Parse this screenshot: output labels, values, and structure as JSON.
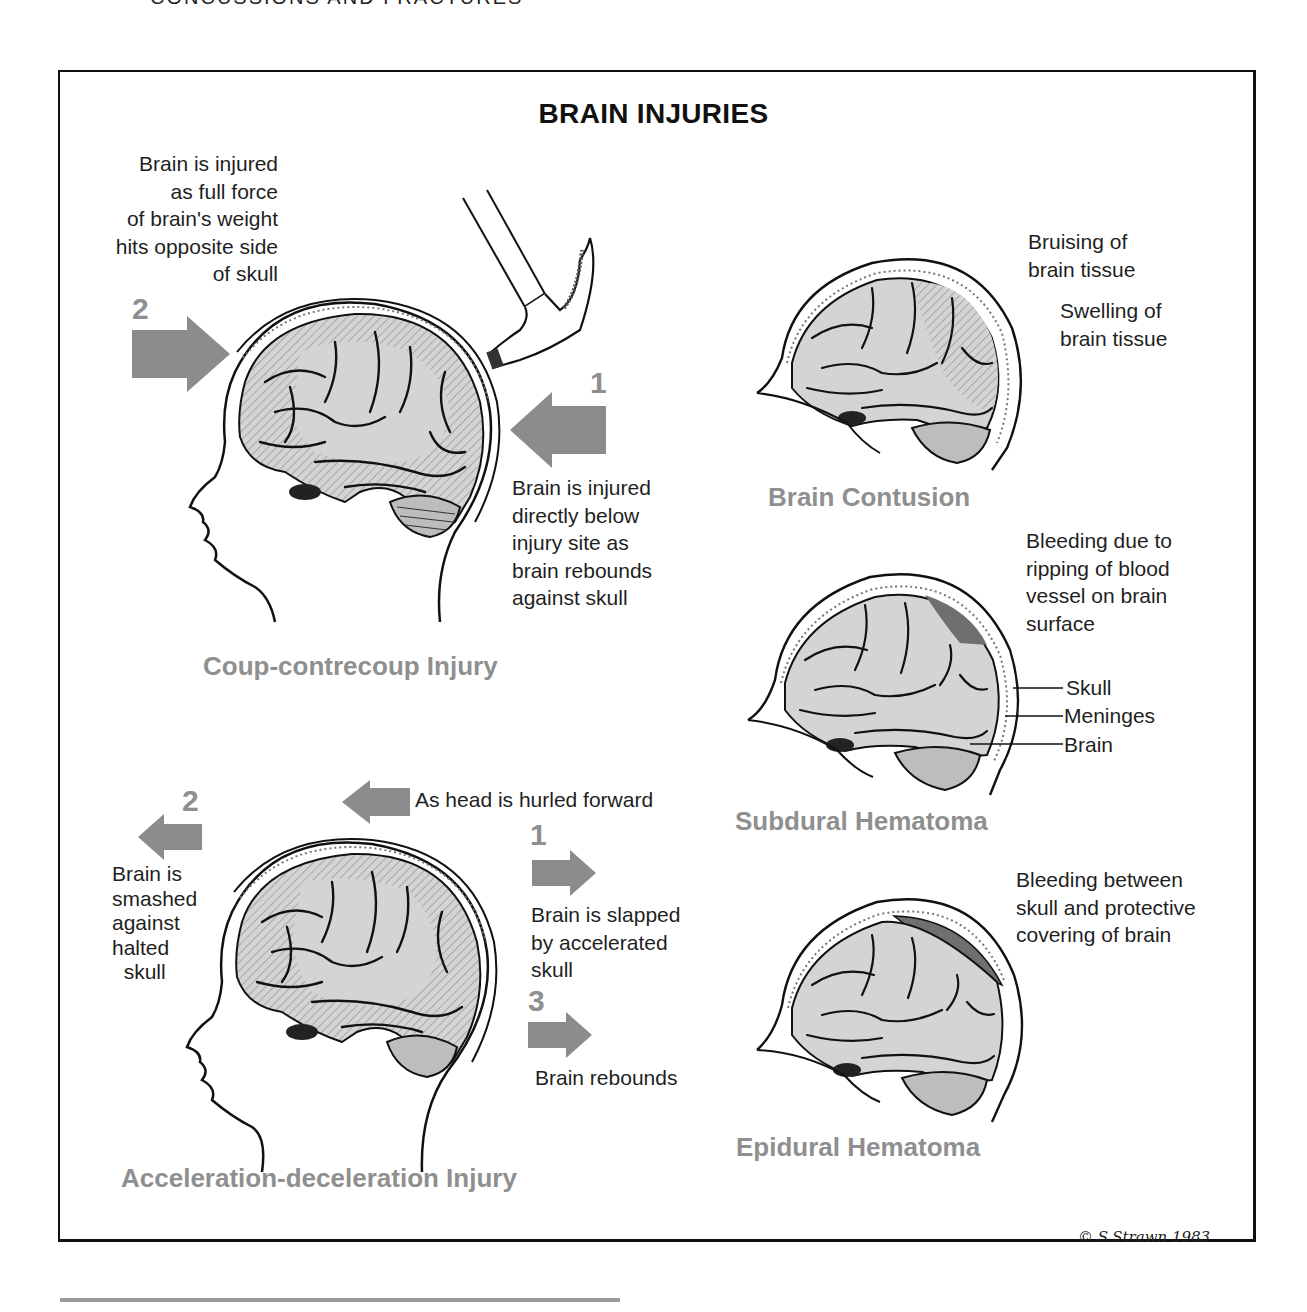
{
  "page_header": "CONCUSSIONS AND FRACTURES",
  "figure": {
    "title": "BRAIN INJURIES",
    "colors": {
      "arrow_gray": "#8c8c8c",
      "brain_fill": "#d4d4d4",
      "hematoma_fill": "#6f6f6f",
      "label_gray": "#8f8f8f",
      "ink": "#111111"
    },
    "panels": {
      "coup_contrecoup": {
        "label": "Coup-contrecoup Injury",
        "step2": {
          "number": "2",
          "caption": "Brain is injured\nas full force\nof brain's weight\nhits opposite side\nof skull"
        },
        "step1": {
          "number": "1",
          "caption": "Brain is injured\ndirectly below\ninjury site as\nbrain rebounds\nagainst skull"
        },
        "icon": "hammer-icon"
      },
      "acceleration_deceleration": {
        "label": "Acceleration-deceleration Injury",
        "head_motion": "As head is hurled forward",
        "step2": {
          "number": "2",
          "caption": "Brain is\nsmashed\nagainst\nhalted\n  skull"
        },
        "step1": {
          "number": "1",
          "caption": "Brain is slapped\nby accelerated\nskull"
        },
        "step3": {
          "number": "3",
          "caption": "Brain rebounds"
        }
      },
      "brain_contusion": {
        "label": "Brain Contusion",
        "notes": [
          "Bruising of\nbrain tissue",
          "Swelling of\nbrain tissue"
        ]
      },
      "subdural_hematoma": {
        "label": "Subdural Hematoma",
        "note": "Bleeding due to\nripping of blood\nvessel on brain\nsurface",
        "leaders": [
          "Skull",
          "Meninges",
          "Brain"
        ]
      },
      "epidural_hematoma": {
        "label": "Epidural Hematoma",
        "note": "Bleeding between\nskull and protective\ncovering of brain"
      }
    },
    "signature": "© S.Strawn 1983"
  }
}
